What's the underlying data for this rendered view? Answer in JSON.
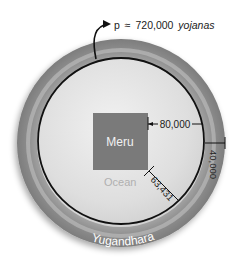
{
  "title": {
    "symbol": "p",
    "approx": "≈",
    "value": "720,000",
    "unit": "yojanas"
  },
  "labels": {
    "mountain": "Meru",
    "inner_region": "Ocean",
    "outer_ring": "Yugandhara"
  },
  "measurements": {
    "meru_to_circle": "80,000",
    "ring_width": "40,000",
    "diagonal": "63,431"
  },
  "colors": {
    "outer_ring": "#8f8f8f",
    "ring_highlight": "#b5b5b5",
    "inner_disk": "#e2e2e2",
    "meru": "#7a7a7a",
    "circle_line": "#111111",
    "ocean_text": "#b0b0b0",
    "meru_text": "#f2f2f2",
    "yugandhara_text": "#ffffff"
  }
}
